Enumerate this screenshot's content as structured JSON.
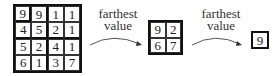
{
  "diagram": {
    "grid_4x4": {
      "rows": [
        [
          "9",
          "9",
          "1",
          "1"
        ],
        [
          "4",
          "5",
          "2",
          "1"
        ],
        [
          "5",
          "2",
          "4",
          "1"
        ],
        [
          "6",
          "1",
          "3",
          "7"
        ]
      ]
    },
    "step1": {
      "label_line1": "farthest",
      "label_line2": "value"
    },
    "grid_2x2": {
      "rows": [
        [
          "9",
          "2"
        ],
        [
          "6",
          "7"
        ]
      ]
    },
    "step2": {
      "label_line1": "farthest",
      "label_line2": "value"
    },
    "grid_1x1": {
      "rows": [
        [
          "9"
        ]
      ]
    }
  }
}
